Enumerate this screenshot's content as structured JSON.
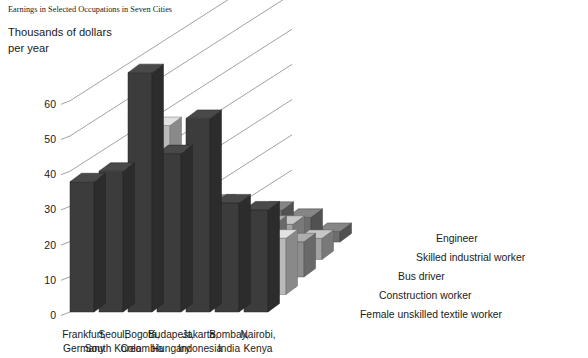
{
  "title": "Earnings in Selected Occupations in Seven Cities",
  "axis": {
    "y_label_line1": "Thousands of dollars",
    "y_label_line2": "per year",
    "y_ticks": [
      "0",
      "10",
      "20",
      "30",
      "40",
      "50",
      "60"
    ]
  },
  "cities": [
    {
      "line1": "Frankfurt,",
      "line2": "Germany"
    },
    {
      "line1": "Seoul,",
      "line2": "South Korea"
    },
    {
      "line1": "Bogotá,",
      "line2": "Colombia"
    },
    {
      "line1": "Budapest,",
      "line2": "Hungary"
    },
    {
      "line1": "Jakarta,",
      "line2": "Indonesia"
    },
    {
      "line1": "Bombay,",
      "line2": "India"
    },
    {
      "line1": "Nairobi,",
      "line2": "Kenya"
    }
  ],
  "legend": [
    {
      "label": "Engineer",
      "color": "#3c3c3c"
    },
    {
      "label": "Skilled industrial worker",
      "color": "#b9b9b9"
    },
    {
      "label": "Bus driver",
      "color": "#8e8e8e"
    },
    {
      "label": "Construction worker",
      "color": "#a3a3a3"
    },
    {
      "label": "Female unskilled textile worker",
      "color": "#6e6e6e"
    }
  ],
  "colors": {
    "engineer": "#3c3c3c",
    "skilled": "#b9b9b9",
    "bus": "#8e8e8e",
    "construction": "#a3a3a3",
    "textile": "#6e6e6e",
    "gridline": "#8a8a8a",
    "background": "#ffffff",
    "text": "#1a1a1a"
  },
  "chart_data": {
    "type": "bar",
    "title": "Earnings in Selected Occupations in Seven Cities",
    "xlabel": "",
    "ylabel": "Thousands of dollars per year",
    "ylim": [
      0,
      70
    ],
    "grid": true,
    "legend_position": "right",
    "projection": "3d-grouped",
    "categories": [
      "Frankfurt, Germany",
      "Seoul, South Korea",
      "Bogotá, Colombia",
      "Budapest, Hungary",
      "Jakarta, Indonesia",
      "Bombay, India",
      "Nairobi, Kenya"
    ],
    "series": [
      {
        "name": "Engineer",
        "color": "#3c3c3c",
        "values": [
          37,
          40,
          68,
          45,
          55,
          31,
          29
        ]
      },
      {
        "name": "Skilled industrial worker",
        "color": "#b9b9b9",
        "values": [
          26,
          30,
          48,
          27,
          24,
          22,
          16
        ]
      },
      {
        "name": "Bus driver",
        "color": "#8e8e8e",
        "values": [
          22,
          19,
          32,
          20,
          16,
          15,
          10
        ]
      },
      {
        "name": "Construction worker",
        "color": "#a3a3a3",
        "values": [
          20,
          18,
          17,
          14,
          12,
          10,
          6
        ]
      },
      {
        "name": "Female unskilled textile worker",
        "color": "#6e6e6e",
        "values": [
          18,
          13,
          11,
          5,
          9,
          7,
          3
        ]
      }
    ]
  }
}
